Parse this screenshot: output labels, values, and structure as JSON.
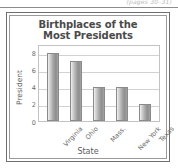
{
  "page_ref": "(pages 30–31)",
  "chart_data": {
    "type": "bar",
    "title": "Birthplaces of the Most Presidents",
    "title_line1": "Birthplaces of the",
    "title_line2": "Most Presidents",
    "categories": [
      "Virginia",
      "Ohio",
      "Mass.",
      "New York",
      "Texas"
    ],
    "values": [
      8,
      7,
      4,
      4,
      2
    ],
    "xlabel": "State",
    "ylabel": "President",
    "ylim": [
      0,
      9
    ],
    "yticks": [
      0,
      2,
      4,
      6,
      8
    ],
    "ytick_labels": [
      "0",
      "2",
      "4",
      "6",
      "8"
    ],
    "grid": true,
    "legend": false,
    "bar_color": "#9a9a9a",
    "grid_color": "#d2d2d2",
    "axis_color": "#c3c3c3"
  }
}
